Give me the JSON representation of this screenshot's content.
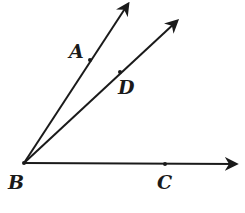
{
  "diagram": {
    "type": "angle-rays",
    "stroke_color": "#1a1a1a",
    "vertex": {
      "name": "B",
      "label": "B",
      "x": 24,
      "y": 163,
      "label_x": 8,
      "label_y": 189
    },
    "rays": [
      {
        "id": "ray-BA",
        "from": "B",
        "through": "A",
        "tip": {
          "x": 128,
          "y": 4
        }
      },
      {
        "id": "ray-BD",
        "from": "B",
        "through": "D",
        "tip": {
          "x": 177,
          "y": 21
        }
      },
      {
        "id": "ray-BC",
        "from": "B",
        "through": "C",
        "tip": {
          "x": 236,
          "y": 164
        }
      }
    ],
    "points": [
      {
        "name": "A",
        "label": "A",
        "x": 90,
        "y": 60,
        "label_x": 69,
        "label_y": 58
      },
      {
        "name": "D",
        "label": "D",
        "x": 120,
        "y": 72,
        "label_x": 118,
        "label_y": 94
      },
      {
        "name": "C",
        "label": "C",
        "x": 165,
        "y": 164,
        "label_x": 157,
        "label_y": 189
      }
    ]
  }
}
